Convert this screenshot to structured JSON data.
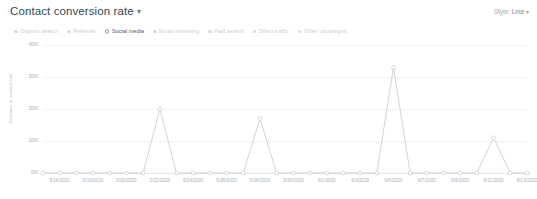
{
  "header": {
    "title": "Contact conversion rate",
    "title_caret": "▾",
    "style_label": "Style:",
    "style_value": "Line",
    "style_caret": "▾"
  },
  "legend": {
    "items": [
      {
        "label": "Organic search",
        "active": false
      },
      {
        "label": "Referrals",
        "active": false
      },
      {
        "label": "Social media",
        "active": true
      },
      {
        "label": "Email marketing",
        "active": false
      },
      {
        "label": "Paid search",
        "active": false
      },
      {
        "label": "Direct traffic",
        "active": false
      },
      {
        "label": "Other campaigns",
        "active": false
      }
    ]
  },
  "colors": {
    "line": "#c8c8c8",
    "marker_stroke": "#c8c8c8",
    "grid": "#f0f2f4",
    "axis": "#e3e6e9",
    "text_muted": "#a8b1ba",
    "text_title": "#33475b"
  },
  "chart_data": {
    "type": "line",
    "title": "Contact conversion rate",
    "xlabel": "",
    "ylabel": "Sessions to contact rate",
    "ylim": [
      0,
      40
    ],
    "yticks": [
      "0%",
      "10%",
      "20%",
      "30%",
      "40%"
    ],
    "ytick_values": [
      0,
      10,
      20,
      30,
      40
    ],
    "grid": true,
    "legend_position": "top",
    "series_name": "Social media",
    "x": [
      "5/15/2020",
      "5/16/2020",
      "5/17/2020",
      "5/18/2020",
      "5/19/2020",
      "5/20/2020",
      "5/21/2020",
      "5/22/2020",
      "5/23/2020",
      "5/24/2020",
      "5/25/2020",
      "5/26/2020",
      "5/27/2020",
      "5/28/2020",
      "5/29/2020",
      "5/30/2020",
      "5/31/2020",
      "6/1/2020",
      "6/2/2020",
      "6/3/2020",
      "6/4/2020",
      "6/5/2020",
      "6/6/2020",
      "6/7/2020",
      "6/8/2020",
      "6/9/2020",
      "6/10/2020",
      "6/11/2020",
      "6/12/2020",
      "6/13/2020"
    ],
    "values": [
      0,
      0,
      0,
      0,
      0,
      0,
      0,
      20,
      0,
      0,
      0,
      0,
      0,
      17,
      0,
      0,
      0,
      0,
      0,
      0,
      0,
      33,
      0,
      0,
      0,
      0,
      0,
      11,
      0,
      0
    ],
    "xtick_labels": [
      "5/16/2020",
      "5/18/2020",
      "5/20/2020",
      "5/22/2020",
      "5/24/2020",
      "5/26/2020",
      "5/28/2020",
      "5/30/2020",
      "6/1/2020",
      "6/3/2020",
      "6/5/2020",
      "6/7/2020",
      "6/9/2020",
      "6/11/2020",
      "6/13/2020"
    ],
    "xtick_indices": [
      1,
      3,
      5,
      7,
      9,
      11,
      13,
      15,
      17,
      19,
      21,
      23,
      25,
      27,
      29
    ]
  }
}
